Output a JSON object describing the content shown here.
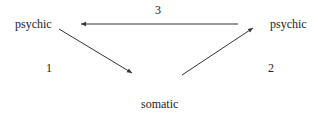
{
  "diagram": {
    "nodes": {
      "psychic_left": "psychic",
      "psychic_right": "psychic",
      "somatic": "somatic"
    },
    "edges": [
      {
        "from": "psychic_left",
        "to": "somatic",
        "label": "1"
      },
      {
        "from": "somatic",
        "to": "psychic_right",
        "label": "2"
      },
      {
        "from": "psychic_right",
        "to": "psychic_left",
        "label": "3"
      }
    ],
    "edge_labels": {
      "one": "1",
      "two": "2",
      "three": "3"
    },
    "colors": {
      "line": "#333333",
      "text": "#222222",
      "background": "#ffffff"
    }
  }
}
